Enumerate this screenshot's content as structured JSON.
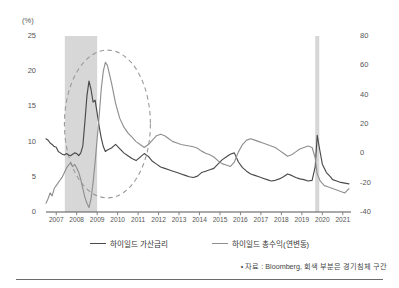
{
  "axes": {
    "left_unit": "(%)",
    "left_ticks": [
      "25",
      "20",
      "15",
      "10",
      "5",
      "0"
    ],
    "right_ticks": [
      "80",
      "60",
      "40",
      "20",
      "0",
      "-20",
      "-40"
    ],
    "x_ticks": [
      "2007",
      "2008",
      "2009",
      "2010",
      "2011",
      "2012",
      "2013",
      "2014",
      "2015",
      "2016",
      "2017",
      "2018",
      "2019",
      "2020",
      "2021"
    ]
  },
  "legend": {
    "items": [
      {
        "label": "하이일드 가산금리",
        "color": "#4a4a4a"
      },
      {
        "label": "하이일드 총수익(연변동)",
        "color": "#8f8f8f"
      }
    ]
  },
  "footnote": {
    "text": "• 자료 : Bloomberg, 회색 부분은 경기침체 구간"
  },
  "chart_data": {
    "type": "line",
    "title": "",
    "xlabel": "",
    "ylabel": "(%)",
    "grid": false,
    "legend_position": "bottom",
    "x_range": [
      2007.0,
      2021.9
    ],
    "left_axis": {
      "label": "(%)",
      "ylim": [
        0,
        25
      ],
      "ticks": [
        0,
        5,
        10,
        15,
        20,
        25
      ]
    },
    "right_axis": {
      "label": "",
      "ylim": [
        -40,
        80
      ],
      "ticks": [
        -40,
        -20,
        0,
        20,
        40,
        60,
        80
      ]
    },
    "recession_bands": [
      {
        "start": 2007.92,
        "end": 2009.5,
        "color": "#d0d0d0",
        "note": "경기침체 구간"
      },
      {
        "start": 2020.15,
        "end": 2020.35,
        "color": "#d0d0d0",
        "note": "경기침체 구간"
      }
    ],
    "annotations": [
      {
        "type": "ellipse",
        "style": "dashed",
        "cx": 2010.0,
        "cy_left": 12.5,
        "rx_years": 2.1,
        "ry_pct": 10.5,
        "color": "#9a9a9a"
      }
    ],
    "series": [
      {
        "name": "하이일드 가산금리",
        "axis": "left",
        "color": "#4a4a4a",
        "unit": "%",
        "x": [
          2007.0,
          2007.1,
          2007.2,
          2007.3,
          2007.4,
          2007.5,
          2007.6,
          2007.7,
          2007.8,
          2007.9,
          2008.0,
          2008.1,
          2008.2,
          2008.3,
          2008.4,
          2008.5,
          2008.6,
          2008.7,
          2008.8,
          2008.9,
          2009.0,
          2009.1,
          2009.2,
          2009.3,
          2009.4,
          2009.5,
          2009.6,
          2009.7,
          2009.8,
          2009.9,
          2010.0,
          2010.2,
          2010.4,
          2010.6,
          2010.8,
          2011.0,
          2011.2,
          2011.4,
          2011.6,
          2011.8,
          2012.0,
          2012.2,
          2012.4,
          2012.6,
          2012.8,
          2013.0,
          2013.2,
          2013.4,
          2013.6,
          2013.8,
          2014.0,
          2014.2,
          2014.4,
          2014.6,
          2014.8,
          2015.0,
          2015.2,
          2015.4,
          2015.6,
          2015.8,
          2016.0,
          2016.2,
          2016.4,
          2016.6,
          2016.8,
          2017.0,
          2017.2,
          2017.4,
          2017.6,
          2017.8,
          2018.0,
          2018.2,
          2018.4,
          2018.6,
          2018.8,
          2019.0,
          2019.2,
          2019.4,
          2019.6,
          2019.8,
          2020.0,
          2020.15,
          2020.25,
          2020.35,
          2020.5,
          2020.7,
          2020.9,
          2021.0,
          2021.2,
          2021.4,
          2021.6,
          2021.8
        ],
        "y": [
          10.4,
          10.2,
          9.8,
          9.6,
          9.3,
          9.2,
          8.6,
          8.4,
          8.2,
          8.1,
          8.3,
          8.1,
          8.0,
          8.2,
          8.4,
          8.3,
          8.0,
          8.4,
          9.4,
          12.8,
          16.5,
          18.6,
          17.4,
          15.6,
          15.9,
          14.0,
          12.1,
          10.5,
          9.3,
          8.6,
          8.8,
          9.1,
          9.6,
          9.0,
          8.4,
          8.0,
          7.6,
          7.3,
          7.8,
          8.3,
          7.9,
          7.2,
          6.8,
          6.4,
          6.2,
          6.0,
          5.8,
          5.6,
          5.4,
          5.2,
          5.0,
          4.9,
          5.1,
          5.6,
          5.8,
          6.0,
          6.2,
          6.8,
          7.4,
          7.8,
          8.2,
          8.4,
          7.1,
          6.3,
          5.8,
          5.4,
          5.2,
          5.0,
          4.8,
          4.6,
          4.4,
          4.5,
          4.7,
          5.0,
          5.4,
          5.2,
          4.9,
          4.7,
          4.6,
          4.4,
          4.5,
          6.4,
          10.9,
          9.2,
          6.8,
          5.6,
          5.0,
          4.6,
          4.4,
          4.2,
          4.1,
          4.0
        ]
      },
      {
        "name": "하이일드 총수익(연변동)",
        "axis": "right",
        "color": "#8f8f8f",
        "unit": "%",
        "x": [
          2007.0,
          2007.1,
          2007.2,
          2007.3,
          2007.4,
          2007.5,
          2007.6,
          2007.7,
          2007.8,
          2007.9,
          2008.0,
          2008.1,
          2008.2,
          2008.3,
          2008.4,
          2008.5,
          2008.6,
          2008.7,
          2008.8,
          2008.9,
          2009.0,
          2009.1,
          2009.2,
          2009.3,
          2009.4,
          2009.5,
          2009.6,
          2009.7,
          2009.8,
          2009.9,
          2010.0,
          2010.2,
          2010.4,
          2010.6,
          2010.8,
          2011.0,
          2011.2,
          2011.4,
          2011.6,
          2011.8,
          2012.0,
          2012.2,
          2012.4,
          2012.6,
          2012.8,
          2013.0,
          2013.2,
          2013.4,
          2013.6,
          2013.8,
          2014.0,
          2014.2,
          2014.4,
          2014.6,
          2014.8,
          2015.0,
          2015.2,
          2015.4,
          2015.6,
          2015.8,
          2016.0,
          2016.2,
          2016.4,
          2016.6,
          2016.8,
          2017.0,
          2017.2,
          2017.4,
          2017.6,
          2017.8,
          2018.0,
          2018.2,
          2018.4,
          2018.6,
          2018.8,
          2019.0,
          2019.2,
          2019.4,
          2019.6,
          2019.8,
          2020.0,
          2020.15,
          2020.25,
          2020.4,
          2020.6,
          2020.8,
          2021.0,
          2021.2,
          2021.4,
          2021.6,
          2021.8
        ],
        "y": [
          -34.0,
          -31.0,
          -27.0,
          -29.0,
          -24.0,
          -22.0,
          -20.0,
          -18.0,
          -16.0,
          -13.0,
          -10.0,
          -8.0,
          -6.5,
          -9.0,
          -7.5,
          -10.0,
          -13.0,
          -18.0,
          -24.0,
          -30.0,
          -34.0,
          -37.0,
          -31.0,
          -20.0,
          -6.0,
          10.0,
          26.0,
          44.0,
          56.0,
          62.0,
          60.0,
          48.0,
          34.0,
          24.0,
          18.0,
          14.0,
          11.0,
          8.0,
          6.0,
          4.0,
          6.0,
          9.0,
          12.0,
          13.0,
          12.0,
          10.0,
          8.0,
          7.0,
          6.0,
          5.5,
          5.0,
          4.5,
          3.5,
          1.5,
          0.0,
          -1.0,
          -2.5,
          -5.0,
          -7.0,
          -8.0,
          -9.0,
          -6.0,
          1.0,
          6.0,
          9.0,
          10.0,
          9.0,
          8.0,
          7.0,
          6.0,
          5.0,
          4.0,
          2.0,
          0.0,
          -2.0,
          -1.0,
          1.0,
          3.0,
          4.0,
          5.0,
          4.0,
          -3.0,
          -14.0,
          -19.0,
          -22.0,
          -23.0,
          -24.0,
          -25.0,
          -26.0,
          -27.0,
          -24.0
        ]
      }
    ]
  }
}
